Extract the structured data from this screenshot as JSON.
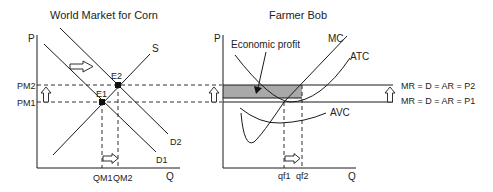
{
  "left_panel": {
    "title": "World Market for Corn",
    "y_axis_label": "P",
    "x_axis_label": "Q",
    "price_labels": {
      "pm2": "PM2",
      "pm1": "PM1"
    },
    "quantity_labels": {
      "qm1": "QM1",
      "qm2": "QM2"
    },
    "curve_labels": {
      "supply": "S",
      "demand1": "D1",
      "demand2": "D2"
    },
    "equilibria": {
      "e1": "E1",
      "e2": "E2"
    }
  },
  "right_panel": {
    "title": "Farmer Bob",
    "y_axis_label": "P",
    "x_axis_label": "Q",
    "shaded_area_label": "Economic profit",
    "curve_labels": {
      "mc": "MC",
      "atc": "ATC",
      "avc": "AVC"
    },
    "price_lines": {
      "p2": "MR = D = AR = P2",
      "p1": "MR = D = AR = P1"
    },
    "quantity_labels": {
      "qf1": "qf1",
      "qf2": "qf2"
    }
  },
  "colors": {
    "line": "#1a1a1a",
    "shade": "#a9a9a9",
    "background": "#ffffff"
  }
}
